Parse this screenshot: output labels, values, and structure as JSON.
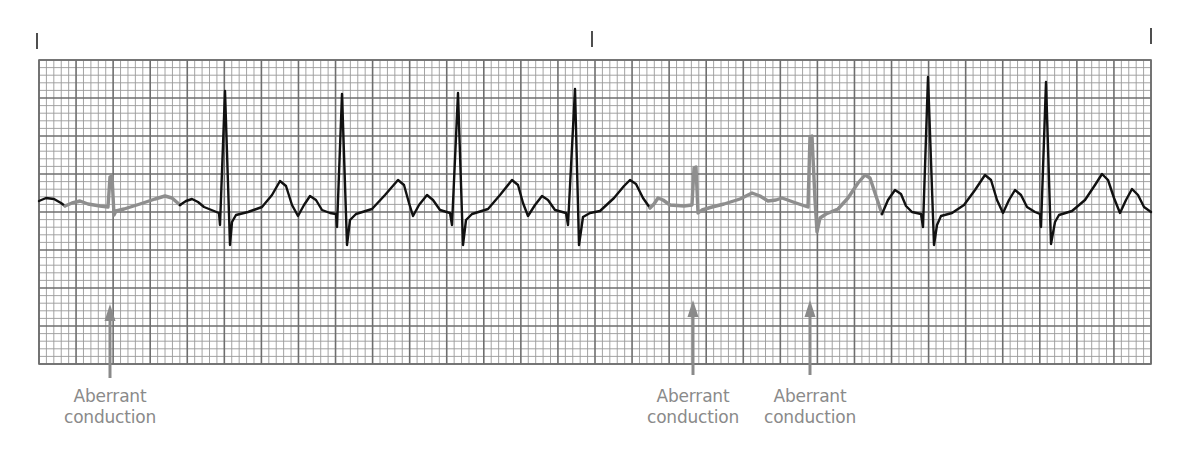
{
  "diagram": {
    "type": "ecg_rhythm_strip",
    "grid": {
      "left": 39,
      "top": 60,
      "right": 1151,
      "bottom": 364,
      "major_cols": 30,
      "major_rows": 8,
      "minor_per_major": 5,
      "minor_color": "#9a9a9a",
      "major_color": "#6e6e6e",
      "border_color": "#6e6e6e"
    },
    "time_marks": [
      {
        "x": 37,
        "y1": 33,
        "y2": 49
      },
      {
        "x": 592,
        "y1": 31,
        "y2": 47
      },
      {
        "x": 1151,
        "y1": 28,
        "y2": 44
      }
    ],
    "colors": {
      "normal_trace": "#111111",
      "aberrant_trace": "#8e8e8e",
      "annotation": "#8a8a8a",
      "tick": "#222222"
    },
    "segments": [
      {
        "kind": "normal",
        "points": [
          [
            39,
            201
          ],
          [
            46,
            198
          ],
          [
            54,
            199
          ],
          [
            61,
            203
          ],
          [
            65,
            206
          ]
        ]
      },
      {
        "kind": "aberrant",
        "points": [
          [
            65,
            206
          ],
          [
            72,
            203
          ],
          [
            80,
            201
          ],
          [
            88,
            204
          ],
          [
            100,
            206
          ],
          [
            108,
            207
          ],
          [
            110,
            177
          ],
          [
            112,
            176
          ],
          [
            114,
            215
          ],
          [
            116,
            211
          ],
          [
            124,
            209
          ],
          [
            140,
            204
          ],
          [
            155,
            199
          ],
          [
            165,
            196
          ],
          [
            172,
            198
          ],
          [
            180,
            205
          ]
        ]
      },
      {
        "kind": "normal",
        "points": [
          [
            180,
            205
          ],
          [
            186,
            201
          ],
          [
            192,
            199
          ],
          [
            198,
            202
          ],
          [
            204,
            207
          ],
          [
            214,
            211
          ],
          [
            219,
            213
          ],
          [
            220,
            225
          ],
          [
            225,
            91
          ],
          [
            230,
            245
          ],
          [
            232,
            222
          ],
          [
            236,
            215
          ],
          [
            248,
            212
          ],
          [
            262,
            207
          ],
          [
            272,
            195
          ],
          [
            280,
            181
          ],
          [
            286,
            186
          ],
          [
            292,
            205
          ],
          [
            298,
            216
          ],
          [
            304,
            205
          ],
          [
            310,
            196
          ],
          [
            316,
            200
          ],
          [
            322,
            210
          ],
          [
            330,
            213
          ],
          [
            336,
            214
          ],
          [
            337,
            227
          ],
          [
            342,
            94
          ],
          [
            347,
            245
          ],
          [
            350,
            220
          ],
          [
            356,
            214
          ],
          [
            372,
            209
          ],
          [
            385,
            195
          ],
          [
            398,
            180
          ],
          [
            404,
            185
          ],
          [
            409,
            203
          ],
          [
            413,
            216
          ],
          [
            419,
            205
          ],
          [
            427,
            195
          ],
          [
            433,
            200
          ],
          [
            440,
            210
          ],
          [
            450,
            213
          ],
          [
            452,
            225
          ],
          [
            458,
            93
          ],
          [
            463,
            245
          ],
          [
            466,
            220
          ],
          [
            472,
            214
          ],
          [
            488,
            209
          ],
          [
            500,
            195
          ],
          [
            512,
            180
          ],
          [
            518,
            185
          ],
          [
            523,
            203
          ],
          [
            528,
            216
          ],
          [
            535,
            205
          ],
          [
            542,
            196
          ],
          [
            548,
            200
          ],
          [
            555,
            210
          ],
          [
            566,
            213
          ],
          [
            568,
            225
          ],
          [
            575,
            89
          ],
          [
            579,
            245
          ],
          [
            583,
            217
          ],
          [
            590,
            213
          ],
          [
            600,
            211
          ],
          [
            614,
            198
          ],
          [
            624,
            186
          ],
          [
            630,
            180
          ],
          [
            636,
            184
          ],
          [
            643,
            198
          ],
          [
            650,
            208
          ]
        ]
      },
      {
        "kind": "aberrant",
        "points": [
          [
            650,
            208
          ],
          [
            654,
            204
          ],
          [
            658,
            198
          ],
          [
            663,
            200
          ],
          [
            670,
            205
          ],
          [
            684,
            206
          ],
          [
            692,
            205
          ],
          [
            694,
            168
          ],
          [
            696,
            167
          ],
          [
            698,
            213
          ],
          [
            702,
            210
          ],
          [
            712,
            207
          ],
          [
            724,
            204
          ],
          [
            740,
            199
          ],
          [
            752,
            193
          ],
          [
            760,
            196
          ],
          [
            768,
            201
          ],
          [
            776,
            200
          ],
          [
            782,
            198
          ],
          [
            796,
            203
          ],
          [
            808,
            207
          ],
          [
            810,
            137
          ],
          [
            812,
            136
          ],
          [
            815,
            200
          ],
          [
            817,
            232
          ],
          [
            820,
            218
          ],
          [
            826,
            214
          ],
          [
            838,
            209
          ],
          [
            848,
            198
          ],
          [
            858,
            183
          ],
          [
            865,
            175
          ],
          [
            870,
            178
          ],
          [
            876,
            196
          ],
          [
            882,
            214
          ]
        ]
      },
      {
        "kind": "normal",
        "points": [
          [
            882,
            214
          ],
          [
            888,
            200
          ],
          [
            895,
            190
          ],
          [
            901,
            194
          ],
          [
            906,
            206
          ],
          [
            912,
            212
          ],
          [
            921,
            214
          ],
          [
            923,
            227
          ],
          [
            928,
            77
          ],
          [
            934,
            245
          ],
          [
            937,
            225
          ],
          [
            941,
            216
          ],
          [
            952,
            213
          ],
          [
            964,
            205
          ],
          [
            975,
            190
          ],
          [
            985,
            175
          ],
          [
            991,
            180
          ],
          [
            997,
            200
          ],
          [
            1003,
            213
          ],
          [
            1009,
            200
          ],
          [
            1015,
            190
          ],
          [
            1021,
            195
          ],
          [
            1027,
            207
          ],
          [
            1035,
            212
          ],
          [
            1040,
            214
          ],
          [
            1041,
            227
          ],
          [
            1046,
            82
          ],
          [
            1051,
            244
          ],
          [
            1055,
            222
          ],
          [
            1059,
            215
          ],
          [
            1072,
            211
          ],
          [
            1085,
            200
          ],
          [
            1095,
            185
          ],
          [
            1102,
            174
          ],
          [
            1108,
            180
          ],
          [
            1114,
            198
          ],
          [
            1120,
            213
          ],
          [
            1126,
            200
          ],
          [
            1132,
            189
          ],
          [
            1138,
            195
          ],
          [
            1144,
            207
          ],
          [
            1151,
            212
          ]
        ]
      }
    ],
    "annotations": [
      {
        "label_line1": "Aberrant",
        "label_line2": "conduction",
        "arrow_x": 110,
        "arrow_tip_y": 304,
        "arrow_tail_y": 378,
        "label_top": 386
      },
      {
        "label_line1": "Aberrant",
        "label_line2": "conduction",
        "arrow_x": 693,
        "arrow_tip_y": 300,
        "arrow_tail_y": 375,
        "label_top": 386
      },
      {
        "label_line1": "Aberrant",
        "label_line2": "conduction",
        "arrow_x": 810,
        "arrow_tip_y": 300,
        "arrow_tail_y": 375,
        "label_top": 386
      }
    ]
  }
}
